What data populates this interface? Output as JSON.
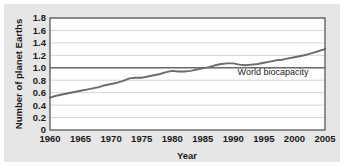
{
  "chart_data": {
    "type": "line",
    "title": "",
    "subtitle": "",
    "xlabel": "Year",
    "ylabel": "Number of planet Earths",
    "xlim": [
      1960,
      2005
    ],
    "ylim": [
      0,
      1.8
    ],
    "grid": true,
    "legend_position": "none",
    "xticks": [
      "1960",
      "1965",
      "1970",
      "1975",
      "1980",
      "1985",
      "1990",
      "1995",
      "2000",
      "2005"
    ],
    "xtick_values": [
      1960,
      1965,
      1970,
      1975,
      1980,
      1985,
      1990,
      1995,
      2000,
      2005
    ],
    "yticks": [
      "0",
      "0.2",
      "0.4",
      "0.6",
      "0.8",
      "1.0",
      "1.2",
      "1.4",
      "1.6",
      "1.8"
    ],
    "ytick_values": [
      0,
      0.2,
      0.4,
      0.6,
      0.8,
      1.0,
      1.2,
      1.4,
      1.6,
      1.8
    ],
    "series": [
      {
        "name": "Humanity's Ecological Footprint",
        "color": "#6b6b6b",
        "x": [
          1960,
          1961,
          1962,
          1963,
          1964,
          1965,
          1966,
          1967,
          1968,
          1969,
          1970,
          1971,
          1972,
          1973,
          1974,
          1975,
          1976,
          1977,
          1978,
          1979,
          1980,
          1981,
          1982,
          1983,
          1984,
          1985,
          1986,
          1987,
          1988,
          1989,
          1990,
          1991,
          1992,
          1993,
          1994,
          1995,
          1996,
          1997,
          1998,
          1999,
          2000,
          2001,
          2002,
          2003,
          2004,
          2005
        ],
        "values": [
          0.52,
          0.55,
          0.57,
          0.59,
          0.61,
          0.63,
          0.65,
          0.67,
          0.69,
          0.72,
          0.74,
          0.76,
          0.79,
          0.83,
          0.84,
          0.84,
          0.86,
          0.88,
          0.9,
          0.93,
          0.95,
          0.94,
          0.94,
          0.95,
          0.97,
          0.99,
          1.01,
          1.04,
          1.06,
          1.07,
          1.07,
          1.05,
          1.04,
          1.05,
          1.06,
          1.08,
          1.1,
          1.12,
          1.13,
          1.15,
          1.17,
          1.19,
          1.21,
          1.24,
          1.27,
          1.3
        ]
      },
      {
        "name": "World biocapacity",
        "color": "#6b6b6b",
        "constant_value": 1.0
      }
    ],
    "annotations": [
      {
        "text": "World biocapacity",
        "x": 1996.5,
        "y": 0.88
      }
    ]
  }
}
